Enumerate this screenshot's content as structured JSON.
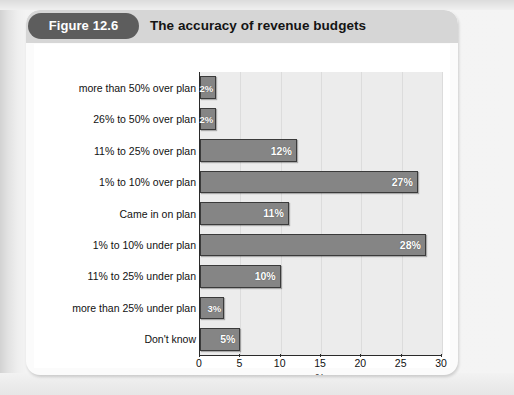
{
  "figure": {
    "number_label": "Figure 12.6",
    "title": "The accuracy of revenue budgets"
  },
  "chart_data": {
    "type": "bar",
    "orientation": "horizontal",
    "title": "The accuracy of revenue budgets",
    "xlabel": "%",
    "ylabel": "",
    "xlim": [
      0,
      30
    ],
    "xticks": [
      0,
      5,
      10,
      15,
      20,
      25,
      30
    ],
    "xticklabels": [
      "0",
      "5",
      "10",
      "15",
      "20",
      "25",
      "30"
    ],
    "grid": true,
    "grid_axis": "x",
    "legend": false,
    "bar_color": "#858585",
    "plot_background": "#ececec",
    "categories": [
      "more than 50% over plan",
      "26% to 50% over plan",
      "11% to 25% over plan",
      "1% to 10% over plan",
      "Came in on plan",
      "1% to 10% under plan",
      "11% to 25% under plan",
      "more than 25% under plan",
      "Don't know"
    ],
    "values": [
      2,
      2,
      12,
      27,
      11,
      28,
      10,
      3,
      5
    ],
    "datalabels": [
      "2%",
      "2%",
      "12%",
      "27%",
      "11%",
      "28%",
      "10%",
      "3%",
      "5%"
    ]
  }
}
